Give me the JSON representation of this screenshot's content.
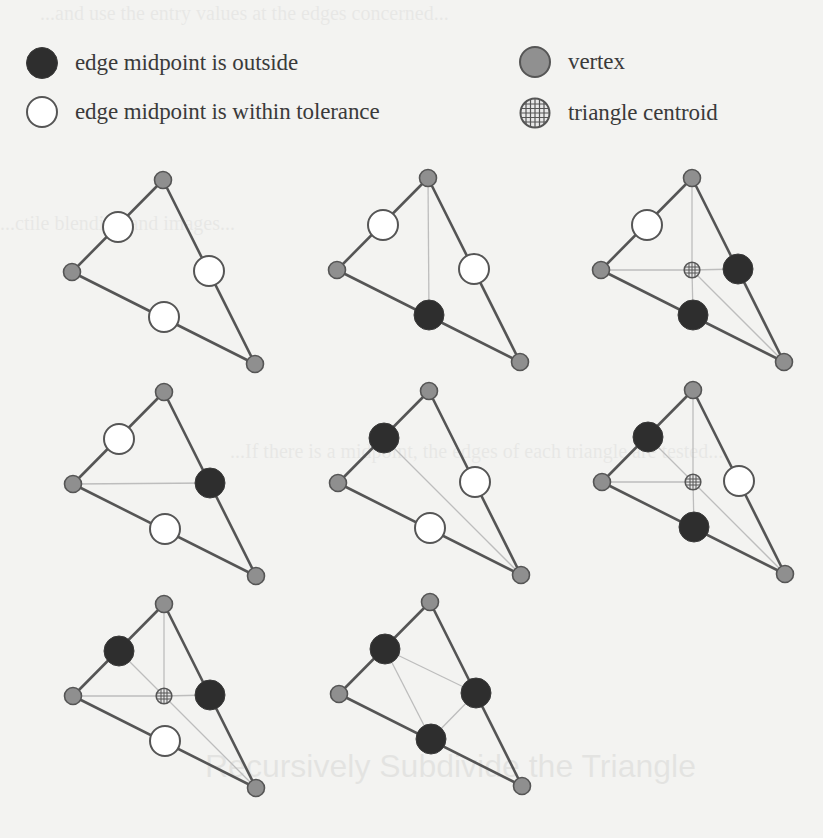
{
  "legend": {
    "items": [
      {
        "id": "outside",
        "label": "edge midpoint is outside",
        "icon": "filled-black-circle-icon",
        "x": 25,
        "y": 46
      },
      {
        "id": "within",
        "label": "edge midpoint is within tolerance",
        "icon": "hollow-white-circle-icon",
        "x": 25,
        "y": 95
      },
      {
        "id": "vertex",
        "label": "vertex",
        "icon": "gray-circle-icon",
        "x": 518,
        "y": 45
      },
      {
        "id": "centroid",
        "label": "triangle centroid",
        "icon": "hatched-circle-icon",
        "x": 518,
        "y": 96
      }
    ]
  },
  "colors": {
    "background": "#f3f3f1",
    "edge": "#555555",
    "guide": "#bdbdbd",
    "outside_fill": "#2e2e2e",
    "within_fill": "#ffffff",
    "vertex_fill": "#8f8f8f",
    "centroid_fill": "#e8e8e8",
    "text": "#3a3a3a"
  },
  "geometry": {
    "note": "offsets relative to the left vertex of each triangle",
    "top": [
      91,
      -92
    ],
    "bottom_right": [
      183,
      92
    ],
    "mid_left_top": [
      46,
      -45
    ],
    "mid_right": [
      137,
      -1
    ],
    "mid_bottom": [
      92,
      45
    ],
    "centroid": [
      91,
      0
    ]
  },
  "cases": [
    {
      "name": "case-no-split",
      "origin": [
        72,
        272
      ],
      "mids": {
        "left_top": "within",
        "right": "within",
        "bottom": "within"
      },
      "centroid": false,
      "guides": []
    },
    {
      "name": "case-split-bottom",
      "origin": [
        337,
        270
      ],
      "mids": {
        "left_top": "within",
        "right": "within",
        "bottom": "outside"
      },
      "centroid": false,
      "guides": [
        [
          "top",
          "mid_bottom"
        ]
      ]
    },
    {
      "name": "case-split-right-bottom",
      "origin": [
        601,
        270
      ],
      "mids": {
        "left_top": "within",
        "right": "outside",
        "bottom": "outside"
      },
      "centroid": true,
      "guides": [
        [
          "centroid",
          "top"
        ],
        [
          "centroid",
          "left"
        ],
        [
          "centroid",
          "mid_right"
        ],
        [
          "centroid",
          "mid_bottom"
        ],
        [
          "centroid",
          "bottom_right"
        ]
      ]
    },
    {
      "name": "case-split-right",
      "origin": [
        73,
        484
      ],
      "mids": {
        "left_top": "within",
        "right": "outside",
        "bottom": "within"
      },
      "centroid": false,
      "guides": [
        [
          "left",
          "mid_right"
        ]
      ]
    },
    {
      "name": "case-split-left-top",
      "origin": [
        338,
        483
      ],
      "mids": {
        "left_top": "outside",
        "right": "within",
        "bottom": "within"
      },
      "centroid": false,
      "guides": [
        [
          "mid_left_top",
          "bottom_right"
        ]
      ]
    },
    {
      "name": "case-split-left-top-bottom",
      "origin": [
        602,
        482
      ],
      "mids": {
        "left_top": "outside",
        "right": "within",
        "bottom": "outside"
      },
      "centroid": true,
      "guides": [
        [
          "centroid",
          "top"
        ],
        [
          "centroid",
          "left"
        ],
        [
          "centroid",
          "mid_bottom"
        ],
        [
          "centroid",
          "bottom_right"
        ],
        [
          "centroid",
          "mid_left_top"
        ]
      ]
    },
    {
      "name": "case-split-left-top-right",
      "origin": [
        73,
        696
      ],
      "mids": {
        "left_top": "outside",
        "right": "outside",
        "bottom": "within"
      },
      "centroid": true,
      "guides": [
        [
          "centroid",
          "top"
        ],
        [
          "centroid",
          "left"
        ],
        [
          "centroid",
          "mid_right"
        ],
        [
          "centroid",
          "bottom_right"
        ],
        [
          "centroid",
          "mid_left_top"
        ]
      ]
    },
    {
      "name": "case-split-all",
      "origin": [
        339,
        694
      ],
      "mids": {
        "left_top": "outside",
        "right": "outside",
        "bottom": "outside"
      },
      "centroid": false,
      "guides": [
        [
          "mid_left_top",
          "mid_right"
        ],
        [
          "mid_right",
          "mid_bottom"
        ],
        [
          "mid_bottom",
          "mid_left_top"
        ]
      ]
    }
  ],
  "background_bleed": {
    "heading": "Recursively Subdivide the Triangle",
    "lines": [
      "...and use the entry values at the edges concerned...",
      "...ctile blending and images...",
      "...If there is a midpoint, the edges of each triangle are tested..."
    ]
  }
}
